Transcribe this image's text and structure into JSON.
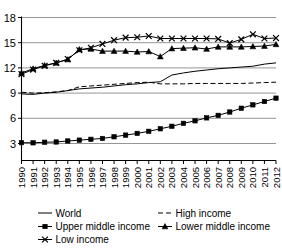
{
  "chart_data": {
    "type": "line",
    "title": "",
    "xlabel": "",
    "ylabel": "",
    "grid": true,
    "legend_position": "bottom",
    "x": [
      "1990",
      "1991",
      "1992",
      "1993",
      "1994",
      "1995",
      "1996",
      "1997",
      "1998",
      "1999",
      "2000",
      "2001",
      "2002",
      "2003",
      "2004",
      "2005",
      "2006",
      "2007",
      "2008",
      "2009",
      "2010",
      "2011",
      "2012"
    ],
    "ylim": [
      1.6,
      18.6
    ],
    "yticks": [
      3,
      6,
      9,
      12,
      15,
      18
    ],
    "ytick_labels": [
      "3",
      "6",
      "9",
      "12",
      "15",
      "18"
    ],
    "series": [
      {
        "name": "World",
        "marker": "none",
        "dash": "solid",
        "values": [
          8.9,
          8.85,
          9.0,
          9.1,
          9.3,
          9.5,
          9.6,
          9.7,
          9.85,
          10.0,
          10.1,
          10.25,
          10.35,
          11.15,
          11.4,
          11.6,
          11.75,
          11.9,
          12.0,
          12.1,
          12.2,
          12.45,
          12.6
        ]
      },
      {
        "name": "High income",
        "marker": "none",
        "dash": "dashed",
        "values": [
          9.1,
          9.0,
          9.05,
          9.15,
          9.3,
          9.75,
          9.85,
          9.95,
          10.05,
          10.15,
          10.25,
          10.3,
          10.1,
          10.1,
          10.1,
          10.15,
          10.15,
          10.15,
          10.15,
          10.15,
          10.2,
          10.25,
          10.3
        ]
      },
      {
        "name": "Upper middle income",
        "marker": "square",
        "dash": "solid",
        "values": [
          3.1,
          3.08,
          3.15,
          3.18,
          3.3,
          3.4,
          3.5,
          3.6,
          3.8,
          4.0,
          4.2,
          4.45,
          4.75,
          5.05,
          5.4,
          5.7,
          6.05,
          6.35,
          6.75,
          7.2,
          7.6,
          8.0,
          8.4
        ]
      },
      {
        "name": "Lower middle income",
        "marker": "triangle",
        "dash": "solid",
        "values": [
          11.4,
          11.9,
          12.3,
          12.6,
          13.0,
          14.2,
          14.25,
          14.0,
          14.0,
          14.0,
          13.9,
          13.95,
          13.35,
          14.3,
          14.35,
          14.4,
          14.25,
          14.5,
          14.5,
          14.5,
          14.55,
          14.6,
          14.8
        ]
      },
      {
        "name": "Low income",
        "marker": "x",
        "dash": "solid",
        "values": [
          11.25,
          11.8,
          12.25,
          12.6,
          13.05,
          14.1,
          14.4,
          14.85,
          15.3,
          15.6,
          15.65,
          15.8,
          15.5,
          15.5,
          15.5,
          15.5,
          15.5,
          15.45,
          14.95,
          15.4,
          16.0,
          15.5,
          15.55
        ]
      }
    ],
    "legend": [
      {
        "label": "World",
        "marker": "none",
        "dash": "solid"
      },
      {
        "label": "High income",
        "marker": "none",
        "dash": "dashed"
      },
      {
        "label": "Upper middle income",
        "marker": "square",
        "dash": "solid"
      },
      {
        "label": "Lower middle income",
        "marker": "triangle",
        "dash": "solid"
      },
      {
        "label": "Low income",
        "marker": "x",
        "dash": "solid"
      }
    ]
  }
}
